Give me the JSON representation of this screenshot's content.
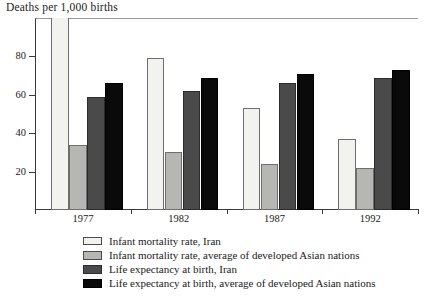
{
  "chart_data": {
    "type": "bar",
    "title": "Deaths per 1,000 births",
    "xlabel": "",
    "ylabel": "",
    "ylim": [
      0,
      100
    ],
    "yticks": [
      20,
      40,
      60,
      80
    ],
    "grid": false,
    "legend_position": "bottom",
    "categories": [
      "1977",
      "1982",
      "1987",
      "1992"
    ],
    "series": [
      {
        "name": "Infant mortality rate, Iran",
        "color": "#f2f2ef",
        "values": [
          104,
          79,
          53,
          37
        ]
      },
      {
        "name": "Infant mortality rate, average of developed Asian nations",
        "color": "#b6b6b2",
        "values": [
          34,
          30,
          24,
          22
        ]
      },
      {
        "name": "Life expectancy at birth, Iran",
        "color": "#4a4a4a",
        "values": [
          59,
          62,
          66,
          69
        ]
      },
      {
        "name": "Life expectancy at birth, average of developed Asian nations",
        "color": "#0a0a0a",
        "values": [
          66,
          69,
          71,
          73
        ]
      }
    ]
  },
  "axis": {
    "y_tick_labels": [
      "80",
      "60",
      "40",
      "20"
    ],
    "x_tick_labels": [
      "1977",
      "1982",
      "1987",
      "1992"
    ]
  },
  "legend": {
    "entries": [
      "Infant mortality rate, Iran",
      "Infant mortality rate, average of developed Asian nations",
      "Life expectancy at birth, Iran",
      "Life expectancy at birth, average of developed Asian nations"
    ]
  }
}
